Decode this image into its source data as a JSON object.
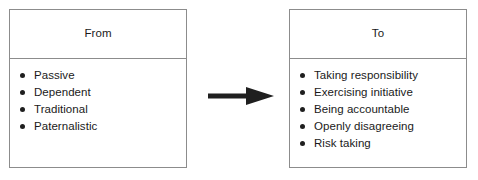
{
  "diagram": {
    "arrow": {
      "icon": "right-arrow-icon",
      "direction": "right"
    },
    "panels": [
      {
        "id": "from",
        "title": "From",
        "items": [
          {
            "label": "Passive"
          },
          {
            "label": "Dependent"
          },
          {
            "label": "Traditional"
          },
          {
            "label": "Paternalistic"
          }
        ]
      },
      {
        "id": "to",
        "title": "To",
        "items": [
          {
            "label": "Taking responsibility"
          },
          {
            "label": "Exercising initiative"
          },
          {
            "label": "Being accountable"
          },
          {
            "label": "Openly disagreeing"
          },
          {
            "label": "Risk taking"
          }
        ]
      }
    ],
    "colors": {
      "border": "#8c8c8c",
      "text": "#1a1a1a",
      "bullet": "#1f1f1f",
      "arrow": "#1f1f1f",
      "background": "#ffffff"
    }
  }
}
